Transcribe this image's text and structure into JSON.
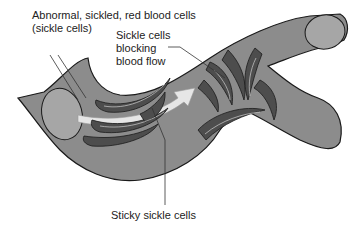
{
  "diagram": {
    "labels": {
      "abnormal_cells": "Abnormal, sickled, red blood cells\n(sickle cells)",
      "blocking": "Sickle cells\nblocking\nblood flow",
      "sticky": "Sticky sickle cells"
    },
    "components": [
      {
        "name": "blood-vessel",
        "color": "#8c8c8c"
      },
      {
        "name": "vessel-opening-left",
        "color": "#a6a6a6"
      },
      {
        "name": "vessel-opening-right",
        "color": "#a6a6a6"
      },
      {
        "name": "sickle-cell",
        "color": "#4d4d4d"
      },
      {
        "name": "blood-flow-arrow",
        "color": "#e6e6e6"
      }
    ]
  }
}
